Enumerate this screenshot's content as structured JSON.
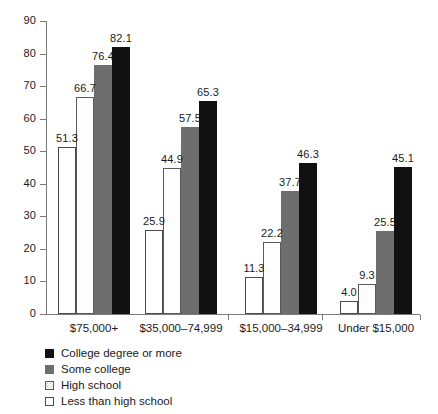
{
  "chart_data": {
    "type": "bar",
    "title": "",
    "xlabel": "",
    "ylabel": "",
    "ylim": [
      0,
      90
    ],
    "ytick_step": 10,
    "yticks": [
      "0",
      "10",
      "20",
      "30",
      "40",
      "50",
      "60",
      "70",
      "80",
      "90"
    ],
    "grid": false,
    "legend_position": "bottom-left",
    "categories": [
      "$75,000+",
      "$35,000–74,999",
      "$15,000–34,999",
      "Under $15,000"
    ],
    "series": [
      {
        "name": "College degree or more",
        "swatch": "black",
        "color": "#111111",
        "values": [
          82.1,
          65.3,
          46.3,
          45.1
        ],
        "labels": [
          "82.1",
          "65.3",
          "46.3",
          "45.1"
        ]
      },
      {
        "name": "Some college",
        "swatch": "gray",
        "color": "#6e6e6e",
        "values": [
          76.4,
          57.5,
          37.7,
          25.5
        ],
        "labels": [
          "76.4",
          "57.5",
          "37.7",
          "25.5"
        ]
      },
      {
        "name": "High school",
        "swatch": "dotted",
        "color": "#fdfdfd",
        "values": [
          66.7,
          44.9,
          22.2,
          9.3
        ],
        "labels": [
          "66.7",
          "44.9",
          "22.2",
          "9.3"
        ]
      },
      {
        "name": "Less than high school",
        "swatch": "white",
        "color": "#ffffff",
        "values": [
          51.3,
          25.9,
          11.3,
          4.0
        ],
        "labels": [
          "51.3",
          "25.9",
          "11.3",
          "4.0"
        ]
      }
    ],
    "bar_order_left_to_right": [
      "Less than high school",
      "High school",
      "Some college",
      "College degree or more"
    ]
  },
  "legend": {
    "items": [
      {
        "label": "College degree or more"
      },
      {
        "label": "Some college"
      },
      {
        "label": "High school"
      },
      {
        "label": "Less than high school"
      }
    ]
  }
}
